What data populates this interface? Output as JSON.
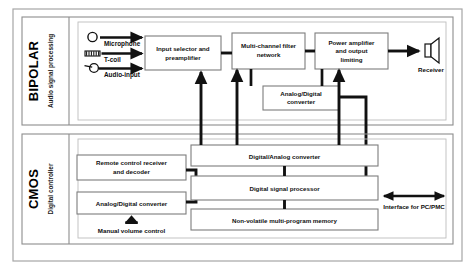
{
  "diagram": {
    "outer_border_color": "#9a9a9a",
    "block_border_color": "#7d7d7d",
    "wire_color": "#111111",
    "background": "#ffffff"
  },
  "sections": [
    {
      "id": "bipolar",
      "title": "BIPOLAR",
      "subtitle": "Audio signal processing"
    },
    {
      "id": "cmos",
      "title": "CMOS",
      "subtitle": "Digital controller"
    }
  ],
  "inputs": [
    {
      "label": "Microphone",
      "icon": "microphone-icon"
    },
    {
      "label": "T-coil",
      "icon": "coil-icon"
    },
    {
      "label": "Audio-input",
      "icon": "audio-jack-icon"
    }
  ],
  "blocks": [
    {
      "id": "input-selector",
      "label": "Input selector and preamplifier",
      "section": "bipolar"
    },
    {
      "id": "filter-network",
      "label": "Multi-channel filter network",
      "section": "bipolar"
    },
    {
      "id": "power-amplifier",
      "label": "Power amplifier and output limiting",
      "section": "bipolar"
    },
    {
      "id": "adc-bipolar",
      "label": "Analog/Digital converter",
      "section": "bipolar"
    },
    {
      "id": "remote-control",
      "label": "Remote control receiver and decoder",
      "section": "cmos"
    },
    {
      "id": "adc-cmos",
      "label": "Analog/Digital converter",
      "section": "cmos"
    },
    {
      "id": "dac",
      "label": "Digital/Analog converter",
      "section": "cmos"
    },
    {
      "id": "dsp",
      "label": "Digital signal processor",
      "section": "cmos"
    },
    {
      "id": "memory",
      "label": "Non-volatile multi-program memory",
      "section": "cmos"
    }
  ],
  "annotations": [
    {
      "id": "receiver",
      "label": "Receiver",
      "icon": "speaker-icon"
    },
    {
      "id": "volume-control",
      "label": "Manual volume control",
      "icon": "up-arrow-knob-icon"
    },
    {
      "id": "pc-interface",
      "label": "Interface for PC/PMC",
      "icon": "bidirectional-arrow-icon"
    }
  ]
}
